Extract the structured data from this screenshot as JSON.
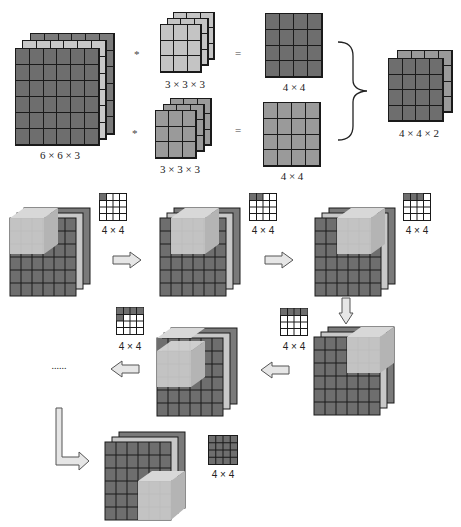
{
  "top_row": {
    "input": {
      "label": "6 × 6 × 3",
      "rows": 6,
      "cols": 6,
      "channels": 3
    },
    "operator_conv": "*",
    "operator_eq": "=",
    "filters": [
      {
        "label": "3 × 3 × 3",
        "rows": 3,
        "cols": 3,
        "channels": 3,
        "shade": "light"
      },
      {
        "label": "3 × 3 × 3",
        "rows": 3,
        "cols": 3,
        "channels": 3,
        "shade": "mid"
      }
    ],
    "outputs": [
      {
        "label": "4 × 4",
        "rows": 4,
        "cols": 4,
        "shade": "dark"
      },
      {
        "label": "4 × 4",
        "rows": 4,
        "cols": 4,
        "shade": "mid"
      }
    ],
    "stacked_output": {
      "label": "4 × 4 × 2",
      "rows": 4,
      "cols": 4,
      "channels": 2
    }
  },
  "steps": [
    {
      "id": 1,
      "output_label": "4 × 4",
      "filled": [
        [
          0,
          0
        ]
      ],
      "filter_pos": "top-left"
    },
    {
      "id": 2,
      "output_label": "4 × 4",
      "filled": [
        [
          0,
          0
        ],
        [
          0,
          1
        ]
      ],
      "filter_pos": "top-second"
    },
    {
      "id": 3,
      "output_label": "4 × 4",
      "filled": [
        [
          0,
          0
        ],
        [
          0,
          1
        ],
        [
          0,
          2
        ]
      ],
      "filter_pos": "top-third"
    },
    {
      "id": 4,
      "output_label": "4 × 4",
      "filled": [
        [
          0,
          0
        ],
        [
          0,
          1
        ],
        [
          0,
          2
        ],
        [
          0,
          3
        ]
      ],
      "filter_pos": "top-right-row2"
    },
    {
      "id": 5,
      "output_label": "4 × 4",
      "filled": [
        [
          0,
          0
        ],
        [
          0,
          1
        ],
        [
          0,
          2
        ],
        [
          0,
          3
        ],
        [
          1,
          0
        ]
      ],
      "filter_pos": "second-row-left"
    },
    {
      "id": 6,
      "output_label": "4 × 4",
      "filled": "all",
      "filter_pos": "bottom-right"
    }
  ],
  "ellipsis": "......",
  "colors": {
    "dark_cell": "#6e6e6e",
    "mid_cell": "#9a9a9a",
    "light_cell": "#c4c4c4",
    "filter_cube": "#c9c9c9",
    "arrow_fill": "#e6e6e6",
    "grid_line": "#1a1a1a"
  }
}
